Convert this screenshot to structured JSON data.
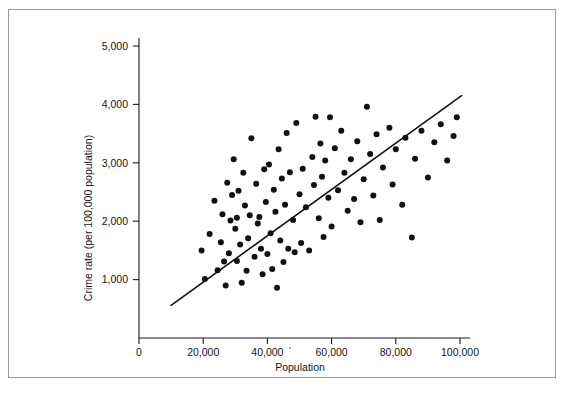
{
  "figure": {
    "background_color": "#ffffff",
    "frame_color": "#9a9a9a",
    "ink_color": "#111111"
  },
  "chart_data": {
    "type": "scatter",
    "title": "",
    "subtitle": "",
    "xlabel": "Population",
    "ylabel": "Crime rate (per 100,000 population)",
    "xlim": [
      0,
      104000
    ],
    "ylim": [
      0,
      5400
    ],
    "grid": false,
    "legend": null,
    "xticks": [
      0,
      20000,
      40000,
      60000,
      80000,
      100000
    ],
    "xtick_labels": [
      "0",
      "20,000",
      "40,000",
      "60,000",
      "80,000",
      "100,000"
    ],
    "yticks": [
      1000,
      2000,
      3000,
      4000,
      5000
    ],
    "ytick_labels": [
      "1,000",
      "2,000",
      "3,000",
      "4,000",
      "5,000"
    ],
    "series": [
      {
        "name": "cities",
        "marker": "filled-circle",
        "marker_color": "#111111",
        "marker_size": 3.0,
        "points": [
          [
            19500,
            1500
          ],
          [
            20500,
            1010
          ],
          [
            22000,
            1780
          ],
          [
            23500,
            2350
          ],
          [
            24500,
            1160
          ],
          [
            25500,
            1640
          ],
          [
            26000,
            2120
          ],
          [
            26500,
            1310
          ],
          [
            27000,
            900
          ],
          [
            27500,
            2660
          ],
          [
            28000,
            1450
          ],
          [
            28500,
            2010
          ],
          [
            29000,
            2450
          ],
          [
            29500,
            3060
          ],
          [
            30000,
            1870
          ],
          [
            30500,
            2060
          ],
          [
            30500,
            1320
          ],
          [
            31000,
            2520
          ],
          [
            31500,
            1600
          ],
          [
            32000,
            945
          ],
          [
            32500,
            2830
          ],
          [
            33000,
            2270
          ],
          [
            33500,
            1150
          ],
          [
            34000,
            1710
          ],
          [
            34500,
            2100
          ],
          [
            35000,
            3420
          ],
          [
            36000,
            1390
          ],
          [
            36500,
            2640
          ],
          [
            37000,
            1960
          ],
          [
            37500,
            2070
          ],
          [
            38000,
            1530
          ],
          [
            38500,
            1090
          ],
          [
            39000,
            2890
          ],
          [
            39500,
            2330
          ],
          [
            40000,
            1440
          ],
          [
            40500,
            2970
          ],
          [
            41000,
            1795
          ],
          [
            41500,
            1180
          ],
          [
            42000,
            2540
          ],
          [
            42500,
            2160
          ],
          [
            43000,
            860
          ],
          [
            43500,
            3230
          ],
          [
            44000,
            1670
          ],
          [
            44500,
            2730
          ],
          [
            45000,
            1300
          ],
          [
            45500,
            2280
          ],
          [
            46000,
            3510
          ],
          [
            46500,
            1530
          ],
          [
            47000,
            2840
          ],
          [
            48000,
            2020
          ],
          [
            48500,
            1470
          ],
          [
            49000,
            3680
          ],
          [
            50000,
            2460
          ],
          [
            50500,
            1625
          ],
          [
            51000,
            2900
          ],
          [
            52000,
            2240
          ],
          [
            53000,
            1500
          ],
          [
            54000,
            3100
          ],
          [
            54500,
            2620
          ],
          [
            55000,
            3790
          ],
          [
            56000,
            2050
          ],
          [
            56500,
            3330
          ],
          [
            57000,
            2760
          ],
          [
            57500,
            1730
          ],
          [
            58000,
            3040
          ],
          [
            59000,
            2400
          ],
          [
            59500,
            3780
          ],
          [
            60000,
            1910
          ],
          [
            61000,
            3250
          ],
          [
            62000,
            2530
          ],
          [
            63000,
            3550
          ],
          [
            64000,
            2830
          ],
          [
            65000,
            2180
          ],
          [
            66000,
            3060
          ],
          [
            67000,
            2380
          ],
          [
            68000,
            3370
          ],
          [
            69000,
            1980
          ],
          [
            70000,
            2720
          ],
          [
            71000,
            3960
          ],
          [
            72000,
            3150
          ],
          [
            73000,
            2440
          ],
          [
            74000,
            3490
          ],
          [
            75000,
            2020
          ],
          [
            76000,
            2920
          ],
          [
            78000,
            3600
          ],
          [
            79000,
            2630
          ],
          [
            80000,
            3230
          ],
          [
            82000,
            2280
          ],
          [
            83000,
            3430
          ],
          [
            85000,
            1720
          ],
          [
            86000,
            3070
          ],
          [
            88000,
            3550
          ],
          [
            90000,
            2750
          ],
          [
            92000,
            3350
          ],
          [
            94000,
            3660
          ],
          [
            96000,
            3040
          ],
          [
            98000,
            3460
          ],
          [
            99000,
            3780
          ]
        ]
      }
    ],
    "fit_line": {
      "name": "least-squares regression line",
      "color": "#111111",
      "x_start": 10000,
      "y_start": 560,
      "x_end": 100500,
      "y_end": 4150
    }
  }
}
